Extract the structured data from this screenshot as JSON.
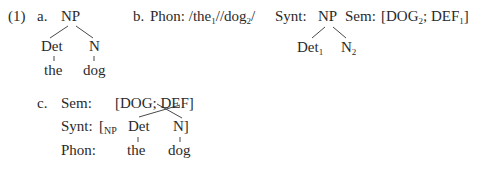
{
  "example_number": "(1)",
  "a": {
    "label": "a.",
    "root": "NP",
    "children": [
      {
        "label": "Det",
        "word": "the"
      },
      {
        "label": "N",
        "word": "dog"
      }
    ]
  },
  "b": {
    "label": "b.",
    "phon_label": "Phon:",
    "phon_slash1": "/",
    "phon_word1": "the",
    "phon_idx1": "1",
    "phon_slash2": "//",
    "phon_word2": "dog",
    "phon_idx2": "2",
    "phon_slash3": "/",
    "synt_label": "Synt:",
    "synt_root": "NP",
    "synt_child1": "Det",
    "synt_idx1": "1",
    "synt_child2": "N",
    "synt_idx2": "2",
    "sem_label": "Sem:",
    "sem_open": "[DOG",
    "sem_idx1": "2",
    "sem_mid": "; DEF",
    "sem_idx2": "1",
    "sem_close": "]"
  },
  "c": {
    "label": "c.",
    "sem_label": "Sem:",
    "sem_value": "[DOG;  DEF]",
    "synt_label": "Synt:",
    "synt_open": "[",
    "synt_np": "NP",
    "synt_det": "Det",
    "synt_n": "N]",
    "phon_label": "Phon:",
    "phon_the": "the",
    "phon_dog": "dog"
  }
}
